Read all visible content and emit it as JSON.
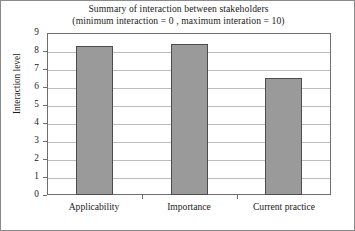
{
  "chart_data": {
    "type": "bar",
    "title": "Summary of interaction between stakeholders",
    "subtitle": "(minimum interaction = 0 , maximum interation = 10)",
    "categories": [
      "Applicability",
      "Importance",
      "Current practice"
    ],
    "values": [
      8.3,
      8.4,
      6.5
    ],
    "xlabel": "",
    "ylabel": "Interaction level",
    "ylim": [
      0,
      9
    ],
    "ytick_labels": [
      "9",
      "8",
      "7",
      "6",
      "5",
      "4",
      "3",
      "2",
      "1",
      "0"
    ],
    "ytick_values": [
      9,
      8,
      7,
      6,
      5,
      4,
      3,
      2,
      1,
      0
    ],
    "grid": true,
    "legend": false,
    "colors": {
      "bar_fill": "#9a9a9a",
      "bar_border": "#4d4d4d",
      "gridline": "#bdbdbd",
      "axis": "#6e6e6e",
      "text": "#1a1a1a",
      "background": "#ffffff"
    }
  }
}
